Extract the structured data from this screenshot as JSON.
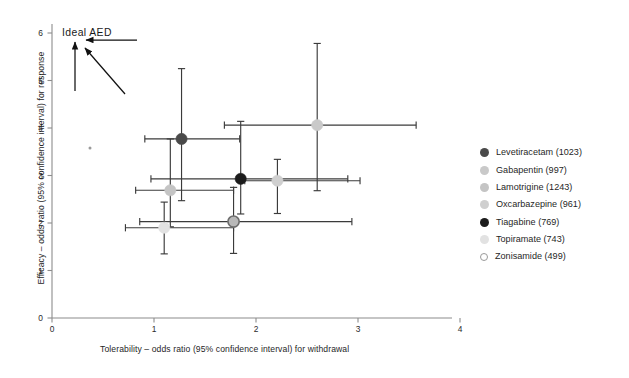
{
  "chart_data": {
    "type": "scatter",
    "title": "",
    "xlabel": "Tolerability – odds ratio (95% confidence interval) for withdrawal",
    "ylabel": "Efficacy – odds ratio (95% confidence interval) for response",
    "xlim": [
      0,
      4.3
    ],
    "ylim": [
      0,
      6.4
    ],
    "xticks": [
      0,
      1,
      2,
      3,
      4
    ],
    "yticks": [
      0,
      1,
      2,
      3,
      4,
      5,
      6
    ],
    "xticklabels": [
      "0",
      "1",
      "2",
      "3",
      "4"
    ],
    "yticklabels": [
      "0",
      "1",
      "2",
      "3",
      "4",
      "5",
      "6"
    ],
    "grid": false,
    "legend_position": "right",
    "annotations": [
      {
        "id": "ideal-aed",
        "text": "Ideal  AED",
        "x": 0.1,
        "y": 6.1
      }
    ],
    "points": [
      {
        "name": "Levetiracetam",
        "n": 1023,
        "label": "Levetiracetam (1023)",
        "color": "#4a4a4a",
        "x": 1.27,
        "x_lo": 0.91,
        "x_hi": 1.84,
        "y": 3.77,
        "y_lo": 2.47,
        "y_hi": 5.25
      },
      {
        "name": "Gabapentin",
        "n": 997,
        "label": "Gabapentin (997)",
        "color": "#c9c9c9",
        "x": 2.6,
        "x_lo": 1.69,
        "x_hi": 3.57,
        "y": 4.06,
        "y_lo": 2.68,
        "y_hi": 5.78
      },
      {
        "name": "Lamotrigine",
        "n": 1243,
        "label": "Lamotrigine (1243)",
        "color": "#c4c4c4",
        "x": 1.16,
        "x_lo": 0.82,
        "x_hi": 1.78,
        "y": 2.69,
        "y_lo": 1.92,
        "y_hi": 3.77
      },
      {
        "name": "Oxcarbazepine",
        "n": 961,
        "label": "Oxcarbazepine (961)",
        "color": "#cfcfcf",
        "x": 2.21,
        "x_lo": 1.89,
        "x_hi": 3.02,
        "y": 2.89,
        "y_lo": 2.2,
        "y_hi": 3.34
      },
      {
        "name": "Tiagabine",
        "n": 769,
        "label": "Tiagabine (769)",
        "color": "#1c1c1c",
        "x": 1.85,
        "x_lo": 0.97,
        "x_hi": 2.9,
        "y": 2.93,
        "y_lo": 2.19,
        "y_hi": 4.14
      },
      {
        "name": "Topiramate",
        "n": 743,
        "label": "Topiramate (743)",
        "color": "#e2e2e2",
        "x": 1.1,
        "x_lo": 0.72,
        "x_hi": 1.78,
        "y": 1.9,
        "y_lo": 1.35,
        "y_hi": 2.44
      },
      {
        "name": "Zonisamide",
        "n": 499,
        "label": "Zonisamide (499)",
        "color": "#b8b8b8",
        "x": 1.78,
        "x_lo": 0.86,
        "x_hi": 2.94,
        "y": 2.03,
        "y_lo": 1.36,
        "y_hi": 2.75
      }
    ]
  },
  "axes": {
    "x_title": "Tolerability – odds ratio (95% confidence interval) for withdrawal",
    "y_title": "Efficacy – odds ratio (95% confidence interval) for response"
  },
  "annotation": {
    "ideal_aed": "Ideal  AED"
  },
  "legend": {
    "items": [
      {
        "label": "Levetiracetam (1023)",
        "color": "#4a4a4a"
      },
      {
        "label": "Gabapentin (997)",
        "color": "#c9c9c9"
      },
      {
        "label": "Lamotrigine (1243)",
        "color": "#c4c4c4"
      },
      {
        "label": "Oxcarbazepine (961)",
        "color": "#cfcfcf"
      },
      {
        "label": "Tiagabine (769)",
        "color": "#1c1c1c"
      },
      {
        "label": "Topiramate (743)",
        "color": "#e2e2e2"
      },
      {
        "label": "Zonisamide (499)",
        "color": "#b8b8b8"
      }
    ]
  },
  "ticks": {
    "x": [
      "0",
      "1",
      "2",
      "3",
      "4"
    ],
    "y": [
      "0",
      "1",
      "2",
      "3",
      "4",
      "5",
      "6"
    ]
  }
}
